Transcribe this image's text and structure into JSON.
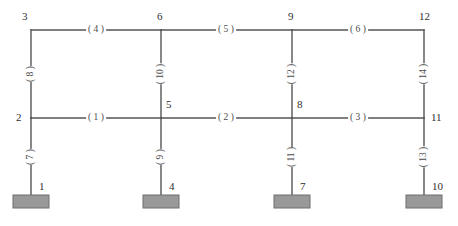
{
  "diagram": {
    "style": {
      "line_color": "#555555",
      "line_width": 1.4,
      "support_fill": "#999999",
      "support_stroke": "#6e6e6e",
      "background": "#ffffff",
      "label_color": "#3a3a3a"
    },
    "geometry": {
      "width": 458,
      "height": 226,
      "column_x": [
        31,
        161,
        292,
        424
      ],
      "level_y": {
        "top": 30,
        "middle": 118,
        "base": 195
      },
      "support_plate": {
        "width": 36,
        "height": 13
      }
    },
    "nodes": [
      {
        "id": "1",
        "label": "1",
        "x": 31,
        "y": 195,
        "label_dx": 8,
        "label_dy": -14
      },
      {
        "id": "2",
        "label": "2",
        "x": 31,
        "y": 118,
        "label_dx": -15,
        "label_dy": -6
      },
      {
        "id": "3",
        "label": "3",
        "x": 31,
        "y": 30,
        "label_dx": -9,
        "label_dy": -19
      },
      {
        "id": "4",
        "label": "4",
        "x": 161,
        "y": 195,
        "label_dx": 8,
        "label_dy": -14
      },
      {
        "id": "5",
        "label": "5",
        "x": 161,
        "y": 118,
        "label_dx": 5,
        "label_dy": -19
      },
      {
        "id": "6",
        "label": "6",
        "x": 161,
        "y": 30,
        "label_dx": -4,
        "label_dy": -19
      },
      {
        "id": "7",
        "label": "7",
        "x": 292,
        "y": 195,
        "label_dx": 8,
        "label_dy": -14
      },
      {
        "id": "8",
        "label": "8",
        "x": 292,
        "y": 118,
        "label_dx": 5,
        "label_dy": -19
      },
      {
        "id": "9",
        "label": "9",
        "x": 292,
        "y": 30,
        "label_dx": -4,
        "label_dy": -19
      },
      {
        "id": "10",
        "label": "10",
        "x": 424,
        "y": 195,
        "label_dx": 8,
        "label_dy": -14
      },
      {
        "id": "11",
        "label": "11",
        "x": 424,
        "y": 118,
        "label_dx": 7,
        "label_dy": -6
      },
      {
        "id": "12",
        "label": "12",
        "x": 424,
        "y": 30,
        "label_dx": -5,
        "label_dy": -19
      }
    ],
    "members": [
      {
        "id": "1",
        "label": "( 1 )",
        "type": "beam",
        "from": "2",
        "to": "5",
        "x": 96,
        "y": 118
      },
      {
        "id": "2",
        "label": "( 2 )",
        "type": "beam",
        "from": "5",
        "to": "8",
        "x": 226,
        "y": 118
      },
      {
        "id": "3",
        "label": "( 3 )",
        "type": "beam",
        "from": "8",
        "to": "11",
        "x": 358,
        "y": 118
      },
      {
        "id": "4",
        "label": "( 4 )",
        "type": "beam",
        "from": "3",
        "to": "6",
        "x": 96,
        "y": 30
      },
      {
        "id": "5",
        "label": "( 5 )",
        "type": "beam",
        "from": "6",
        "to": "9",
        "x": 226,
        "y": 30
      },
      {
        "id": "6",
        "label": "( 6 )",
        "type": "beam",
        "from": "9",
        "to": "12",
        "x": 358,
        "y": 30
      },
      {
        "id": "7",
        "label": "( 7 )",
        "type": "column",
        "from": "1",
        "to": "2",
        "x": 31,
        "y": 157
      },
      {
        "id": "8",
        "label": "( 8 )",
        "type": "column",
        "from": "2",
        "to": "3",
        "x": 31,
        "y": 74
      },
      {
        "id": "9",
        "label": "( 9 )",
        "type": "column",
        "from": "4",
        "to": "5",
        "x": 161,
        "y": 157
      },
      {
        "id": "10",
        "label": "( 10 )",
        "type": "column",
        "from": "5",
        "to": "6",
        "x": 161,
        "y": 74
      },
      {
        "id": "11",
        "label": "( 11 )",
        "type": "column",
        "from": "7",
        "to": "8",
        "x": 292,
        "y": 157
      },
      {
        "id": "12",
        "label": "( 12 )",
        "type": "column",
        "from": "8",
        "to": "9",
        "x": 292,
        "y": 74
      },
      {
        "id": "13",
        "label": "( 13 )",
        "type": "column",
        "from": "10",
        "to": "11",
        "x": 424,
        "y": 157
      },
      {
        "id": "14",
        "label": "( 14 )",
        "type": "column",
        "from": "11",
        "to": "12",
        "x": 424,
        "y": 74
      }
    ],
    "supports": [
      {
        "node": "1",
        "x": 31,
        "y": 195
      },
      {
        "node": "4",
        "x": 161,
        "y": 195
      },
      {
        "node": "7",
        "x": 292,
        "y": 195
      },
      {
        "node": "10",
        "x": 424,
        "y": 195
      }
    ]
  }
}
